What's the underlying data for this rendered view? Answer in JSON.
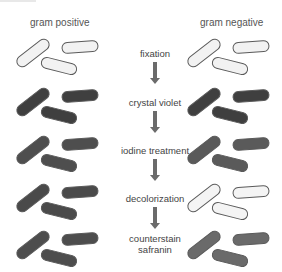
{
  "columns": {
    "left_title": "gram positive",
    "right_title": "gram negative"
  },
  "steps": [
    {
      "label": "fixation",
      "top": 48,
      "left_color": "#f2f2f2",
      "right_color": "#f2f2f2",
      "row_top": 42
    },
    {
      "label": "crystal violet",
      "top": 97,
      "left_color": "#3f3f3f",
      "right_color": "#3f3f3f",
      "row_top": 91
    },
    {
      "label": "iodine treatment",
      "top": 145,
      "left_color": "#4e4e4e",
      "right_color": "#5a5a5a",
      "row_top": 139
    },
    {
      "label": "decolorization",
      "top": 193,
      "left_color": "#4a4a4a",
      "right_color": "#f4f4f4",
      "row_top": 187
    },
    {
      "label": "counterstain",
      "label2": "safranin",
      "top": 233,
      "left_color": "#4d4d4d",
      "right_color": "#6a6a6a",
      "row_top": 234
    }
  ],
  "arrows": [
    {
      "top": 62,
      "height": 22
    },
    {
      "top": 111,
      "height": 22
    },
    {
      "top": 159,
      "height": 22
    },
    {
      "top": 207,
      "height": 22
    }
  ],
  "colors": {
    "outline": "#5a5a5a",
    "arrow": "#6b6b6b",
    "text": "#444444"
  }
}
